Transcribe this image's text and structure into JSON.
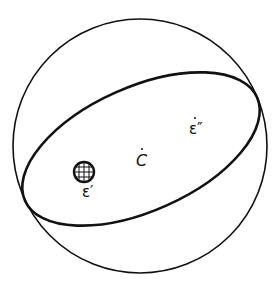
{
  "diagram": {
    "type": "celestial-sphere",
    "elements": {
      "sphere": {
        "shape": "circle",
        "stroke": "#111111"
      },
      "orbit_plane": {
        "shape": "tilted-ellipse",
        "stroke": "#111111"
      },
      "earth": {
        "icon": "globe-icon"
      }
    },
    "labels": {
      "center": "C",
      "epsilon_prime": "ε′",
      "epsilon_double_prime": "ε″"
    }
  }
}
